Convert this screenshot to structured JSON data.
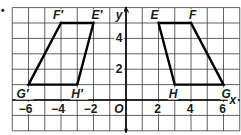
{
  "figure": {
    "bullet": "•",
    "grid": {
      "x_min": -7,
      "x_max": 7,
      "y_min": -2,
      "y_max": 6
    },
    "axes": {
      "x_label": "x",
      "y_label": "y",
      "origin_label": "O",
      "x_ticks": [
        {
          "value": -6,
          "label": "−6"
        },
        {
          "value": -4,
          "label": "−4"
        },
        {
          "value": -2,
          "label": "−2"
        },
        {
          "value": 2,
          "label": "2"
        },
        {
          "value": 4,
          "label": "4"
        },
        {
          "value": 6,
          "label": "6"
        }
      ],
      "y_ticks": [
        {
          "value": 2,
          "label": "2"
        },
        {
          "value": 4,
          "label": "4"
        }
      ]
    },
    "shapes": [
      {
        "name": "trapezoid-efgh",
        "vertices": [
          {
            "label": "E",
            "x": 2,
            "y": 5
          },
          {
            "label": "F",
            "x": 4,
            "y": 5
          },
          {
            "label": "G",
            "x": 6,
            "y": 1
          },
          {
            "label": "H",
            "x": 3,
            "y": 1
          }
        ]
      },
      {
        "name": "trapezoid-e-prime",
        "vertices": [
          {
            "label": "E′",
            "x": -2,
            "y": 5
          },
          {
            "label": "F′",
            "x": -4,
            "y": 5
          },
          {
            "label": "G′",
            "x": -6,
            "y": 1
          },
          {
            "label": "H′",
            "x": -3,
            "y": 1
          }
        ]
      }
    ],
    "colors": {
      "grid": "#3a3a3a",
      "shape": "#000000",
      "text": "#1a1a1a"
    }
  }
}
